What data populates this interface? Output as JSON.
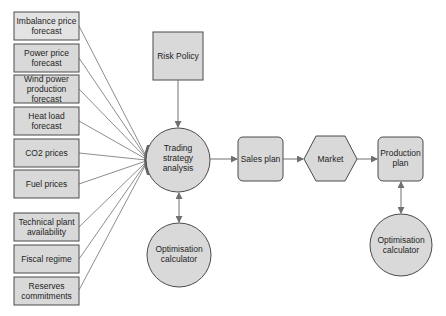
{
  "diagram": {
    "colors": {
      "fill": "#d9d9d9",
      "stroke": "#4a4a4a",
      "line": "#707070",
      "background": "#ffffff"
    },
    "inputs": [
      {
        "id": "imbalance",
        "lines": [
          "Imbalance price",
          "forecast"
        ]
      },
      {
        "id": "power-price",
        "lines": [
          "Power price",
          "forecast"
        ]
      },
      {
        "id": "wind-power",
        "lines": [
          "Wind power",
          "production",
          "forecast"
        ]
      },
      {
        "id": "heat-load",
        "lines": [
          "Heat load",
          "forecast"
        ]
      },
      {
        "id": "co2",
        "lines": [
          "CO2 prices"
        ]
      },
      {
        "id": "fuel",
        "lines": [
          "Fuel prices"
        ]
      },
      {
        "id": "technical",
        "lines": [
          "Technical plant",
          "availability"
        ]
      },
      {
        "id": "fiscal",
        "lines": [
          "Fiscal regime"
        ]
      },
      {
        "id": "reserves",
        "lines": [
          "Reserves",
          "commitments"
        ]
      }
    ],
    "risk_policy": {
      "lines": [
        "Risk Policy"
      ]
    },
    "trading": {
      "lines": [
        "Trading",
        "strategy",
        "analysis"
      ]
    },
    "optimisation_left": {
      "lines": [
        "Optimisation",
        "calculator"
      ]
    },
    "sales_plan": {
      "lines": [
        "Sales plan"
      ]
    },
    "market": {
      "lines": [
        "Market"
      ]
    },
    "production_plan": {
      "lines": [
        "Production",
        "plan"
      ]
    },
    "optimisation_right": {
      "lines": [
        "Optimisation",
        "calculator"
      ]
    }
  }
}
